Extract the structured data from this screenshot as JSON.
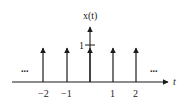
{
  "diagram": {
    "title": "x(t)",
    "y_axis_label": "x(t)",
    "x_axis_label": "t",
    "y_tick_label": "1",
    "left_ellipsis": "...",
    "right_ellipsis": "...",
    "impulses": [
      {
        "t": -2,
        "label": "−2"
      },
      {
        "t": -1,
        "label": "−1"
      },
      {
        "t": 0,
        "label": ""
      },
      {
        "t": 1,
        "label": "1"
      },
      {
        "t": 2,
        "label": "2"
      }
    ],
    "impulse_amplitude": 1,
    "line_color": "#1a1a1a"
  }
}
